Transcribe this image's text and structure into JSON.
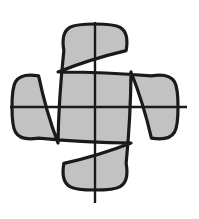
{
  "figure": {
    "name": "quatrefoil-with-cross-axes",
    "caption": "",
    "background_color": "#ffffff",
    "canvas": {
      "width": 199,
      "height": 219
    },
    "shape": {
      "type": "quatrefoil",
      "fill_color": "#c2c2c2",
      "stroke_color": "#1a1a1a",
      "stroke_width": 3.2,
      "lobe_count": 4,
      "center": {
        "x": 95,
        "y": 107
      },
      "lobe_radius": 38,
      "lobe_offset": 45,
      "extents": {
        "top": 21,
        "bottom": 204,
        "left": 9,
        "right": 188
      },
      "lobes": [
        {
          "name": "top-lobe",
          "cx": 95,
          "cy": 62,
          "r": 38
        },
        {
          "name": "right-lobe",
          "cx": 140,
          "cy": 107,
          "r": 38
        },
        {
          "name": "bottom-lobe",
          "cx": 95,
          "cy": 152,
          "r": 38
        },
        {
          "name": "left-lobe",
          "cx": 50,
          "cy": 107,
          "r": 38
        }
      ],
      "cusps": [
        {
          "name": "cusp-top-left",
          "x": 58,
          "y": 72
        },
        {
          "name": "cusp-top-right",
          "x": 131,
          "y": 72
        },
        {
          "name": "cusp-bottom-right",
          "x": 131,
          "y": 143
        },
        {
          "name": "cusp-bottom-left",
          "x": 58,
          "y": 143
        }
      ]
    },
    "axes": {
      "stroke_color": "#1a1a1a",
      "stroke_width": 2.4,
      "vertical": {
        "name": "vertical-axis-line",
        "x": 95,
        "y1": 22,
        "y2": 203
      },
      "horizontal": {
        "name": "horizontal-axis-line",
        "y": 107,
        "x1": 10,
        "x2": 187
      }
    }
  }
}
